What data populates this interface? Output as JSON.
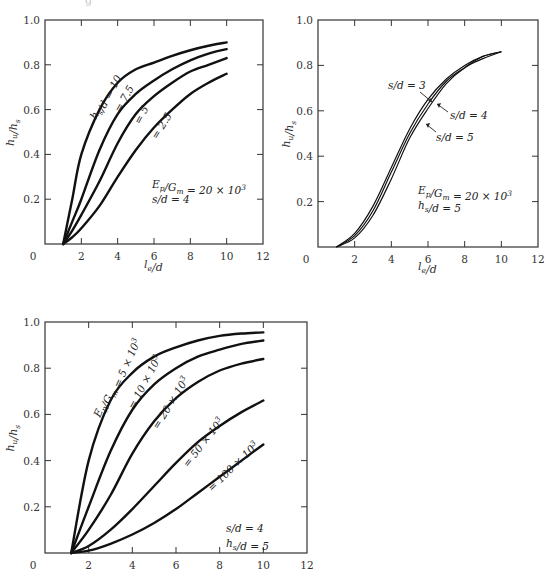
{
  "page": {
    "clipped_caption": "g"
  },
  "chart_data": [
    {
      "id": "panel-a",
      "type": "line",
      "title": "",
      "xlabel": "l_e/d",
      "ylabel": "h_u/h_s",
      "xlim": [
        0,
        12
      ],
      "ylim": [
        0,
        1.0
      ],
      "xticks": [
        "0",
        "2",
        "4",
        "6",
        "8",
        "10",
        "12"
      ],
      "yticks": [
        "0.2",
        "0.4",
        "0.6",
        "0.8",
        "1.0"
      ],
      "grid": false,
      "annotation": [
        "E_p/G_m = 20 × 10^3",
        "s/d = 4"
      ],
      "x": [
        1,
        1.5,
        2,
        3,
        4,
        5,
        6,
        7,
        8,
        9,
        10
      ],
      "series": [
        {
          "name": "h_s/d = 10",
          "label": "h_s/d = 10",
          "values": [
            0.0,
            0.2,
            0.4,
            0.6,
            0.72,
            0.78,
            0.81,
            0.84,
            0.865,
            0.885,
            0.9
          ]
        },
        {
          "name": "h_s/d = 7.5",
          "label": "= 7.5",
          "values": [
            0.0,
            0.1,
            0.2,
            0.42,
            0.58,
            0.67,
            0.73,
            0.78,
            0.82,
            0.85,
            0.87
          ]
        },
        {
          "name": "h_s/d = 5",
          "label": "= 5",
          "values": [
            0.0,
            0.06,
            0.13,
            0.28,
            0.45,
            0.58,
            0.66,
            0.72,
            0.77,
            0.8,
            0.83
          ]
        },
        {
          "name": "h_s/d = 2.5",
          "label": "= 2.5",
          "values": [
            0.0,
            0.03,
            0.07,
            0.17,
            0.3,
            0.42,
            0.52,
            0.6,
            0.67,
            0.72,
            0.76
          ]
        }
      ]
    },
    {
      "id": "panel-b",
      "type": "line",
      "title": "",
      "xlabel": "l_e/d",
      "ylabel": "h_u/h_s",
      "xlim": [
        0,
        12
      ],
      "ylim": [
        0,
        1.0
      ],
      "xticks": [
        "0",
        "2",
        "4",
        "6",
        "8",
        "10",
        "12"
      ],
      "yticks": [
        "0.2",
        "0.4",
        "0.6",
        "0.8",
        "1.0"
      ],
      "grid": false,
      "annotation": [
        "E_p/G_m = 20 × 10^3",
        "h_s/d = 5"
      ],
      "x": [
        1,
        2,
        3,
        4,
        5,
        6,
        7,
        8,
        9,
        10
      ],
      "series": [
        {
          "name": "s/d = 3",
          "label": "s/d = 3",
          "values": [
            0.0,
            0.06,
            0.18,
            0.35,
            0.52,
            0.65,
            0.74,
            0.8,
            0.84,
            0.86
          ]
        },
        {
          "name": "s/d = 4",
          "label": "s/d = 4",
          "values": [
            0.0,
            0.05,
            0.16,
            0.33,
            0.5,
            0.63,
            0.73,
            0.79,
            0.84,
            0.86
          ]
        },
        {
          "name": "s/d = 5",
          "label": "s/d = 5",
          "values": [
            0.0,
            0.04,
            0.14,
            0.3,
            0.48,
            0.61,
            0.72,
            0.79,
            0.83,
            0.86
          ]
        }
      ]
    },
    {
      "id": "panel-c",
      "type": "line",
      "title": "",
      "xlabel": "",
      "ylabel": "h_u/h_s",
      "xlim": [
        0,
        12
      ],
      "ylim": [
        0,
        1.0
      ],
      "xticks": [
        "0",
        "2",
        "4",
        "6",
        "8",
        "10",
        "12"
      ],
      "yticks": [
        "0.2",
        "0.4",
        "0.6",
        "0.8",
        "1.0"
      ],
      "grid": false,
      "annotation": [
        "s/d = 4",
        "h_s/d = 5"
      ],
      "x": [
        1.2,
        2,
        3,
        4,
        5,
        6,
        7,
        8,
        9,
        10
      ],
      "series": [
        {
          "name": "E_p/G_m = 5 × 10^3",
          "label": "E_p/G_m = 5 × 10^3",
          "values": [
            0.0,
            0.4,
            0.66,
            0.78,
            0.85,
            0.89,
            0.92,
            0.94,
            0.95,
            0.955
          ]
        },
        {
          "name": "E_p/G_m = 10 × 10^3",
          "label": "= 10 × 10^3",
          "values": [
            0.0,
            0.2,
            0.44,
            0.62,
            0.73,
            0.8,
            0.85,
            0.88,
            0.905,
            0.92
          ]
        },
        {
          "name": "E_p/G_m = 20 × 10^3",
          "label": "= 20 × 10^3",
          "values": [
            0.0,
            0.1,
            0.25,
            0.43,
            0.57,
            0.67,
            0.74,
            0.79,
            0.82,
            0.84
          ]
        },
        {
          "name": "E_p/G_m = 50 × 10^3",
          "label": "= 50 × 10^3",
          "values": [
            0.0,
            0.03,
            0.1,
            0.19,
            0.29,
            0.39,
            0.48,
            0.55,
            0.61,
            0.66
          ]
        },
        {
          "name": "E_p/G_m = 100 × 10^3",
          "label": "= 100 × 10^3",
          "values": [
            0.0,
            0.01,
            0.04,
            0.08,
            0.13,
            0.19,
            0.26,
            0.33,
            0.4,
            0.47
          ]
        }
      ]
    }
  ]
}
